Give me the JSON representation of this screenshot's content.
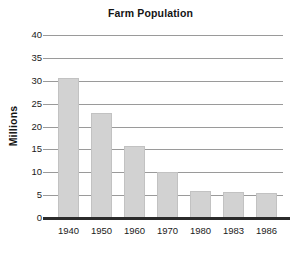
{
  "chart_data": {
    "type": "bar",
    "title": "Farm Population",
    "xlabel": "",
    "ylabel": "Millions",
    "categories": [
      "1940",
      "1950",
      "1960",
      "1970",
      "1980",
      "1983",
      "1986"
    ],
    "values": [
      30.5,
      23.0,
      15.8,
      10.0,
      5.9,
      5.6,
      5.4
    ],
    "series": [
      {
        "name": "Farm Population",
        "values": [
          30.5,
          23.0,
          15.8,
          10.0,
          5.9,
          5.6,
          5.4
        ]
      }
    ],
    "ylim": [
      0,
      40
    ],
    "ytick_labels": [
      "0",
      "5",
      "10",
      "15",
      "20",
      "25",
      "30",
      "35",
      "40"
    ],
    "ytick_values": [
      0,
      5,
      10,
      15,
      20,
      25,
      30,
      35,
      40
    ],
    "grid": true,
    "legend": false,
    "legend_position": "none",
    "bar_color": "#d2d2d2",
    "bar_edge_color": "#c2c2c2",
    "gridline_color": "#9a9a9a",
    "axis_color": "#2b2b2b",
    "background_color": "#ffffff"
  }
}
